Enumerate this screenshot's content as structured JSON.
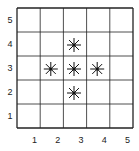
{
  "grid": {
    "columns": 5,
    "rows": 5,
    "x_labels": [
      "1",
      "2",
      "3",
      "4",
      "5"
    ],
    "y_labels": [
      "1",
      "2",
      "3",
      "4",
      "5"
    ]
  },
  "markers": [
    {
      "x": 3,
      "y": 4,
      "icon": "asterisk-icon"
    },
    {
      "x": 2,
      "y": 3,
      "icon": "asterisk-icon"
    },
    {
      "x": 3,
      "y": 3,
      "icon": "asterisk-icon"
    },
    {
      "x": 4,
      "y": 3,
      "icon": "asterisk-icon"
    },
    {
      "x": 3,
      "y": 2,
      "icon": "asterisk-icon"
    }
  ],
  "colors": {
    "line": "#222222",
    "marker": "#111111"
  }
}
